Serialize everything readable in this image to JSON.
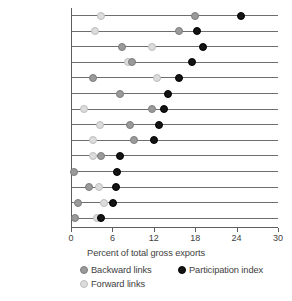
{
  "chart_data": {
    "type": "scatter",
    "title": "",
    "xlabel": "Percent of total gross exports",
    "ylabel": "",
    "xlim": [
      0,
      30
    ],
    "xticks": [
      0,
      6,
      12,
      18,
      24,
      30
    ],
    "grid": false,
    "legend_position": "bottom",
    "orientation": "horizontal-dot-plot",
    "categories": [
      "Malaysia",
      "China",
      "Philippines",
      "Korea, Rep,",
      "Japan",
      "Singapore",
      "Mexico",
      "Thailand",
      "Vietnam",
      "Poland",
      "Chile",
      "Germany",
      "United States",
      "South Africa"
    ],
    "series": [
      {
        "name": "Backward links",
        "color": "#9a9a9a",
        "marker": "circle-gray",
        "values": [
          18.0,
          15.7,
          7.4,
          8.8,
          3.2,
          7.1,
          11.8,
          8.6,
          9.2,
          4.4,
          0.5,
          2.6,
          1.0,
          0.6
        ]
      },
      {
        "name": "Forward links",
        "color": "#dcdcdc",
        "marker": "circle-light",
        "values": [
          4.4,
          3.5,
          11.8,
          8.3,
          12.5,
          null,
          1.9,
          4.2,
          3.2,
          3.2,
          null,
          4.0,
          4.8,
          3.8
        ]
      },
      {
        "name": "Participation index",
        "color": "#141414",
        "marker": "circle-black",
        "values": [
          24.6,
          18.3,
          19.1,
          17.6,
          15.6,
          14.0,
          13.5,
          12.8,
          12.1,
          7.1,
          6.7,
          6.5,
          6.1,
          4.4
        ]
      }
    ]
  },
  "axis": {
    "x_title": "Percent of total gross exports",
    "tick_labels": [
      "0",
      "6",
      "12",
      "18",
      "24",
      "30"
    ]
  },
  "legend": {
    "items": [
      {
        "label": "Backward links",
        "color": "#9a9a9a"
      },
      {
        "label": "Forward links",
        "color": "#dcdcdc"
      },
      {
        "label": "Participation index",
        "color": "#141414"
      }
    ]
  }
}
